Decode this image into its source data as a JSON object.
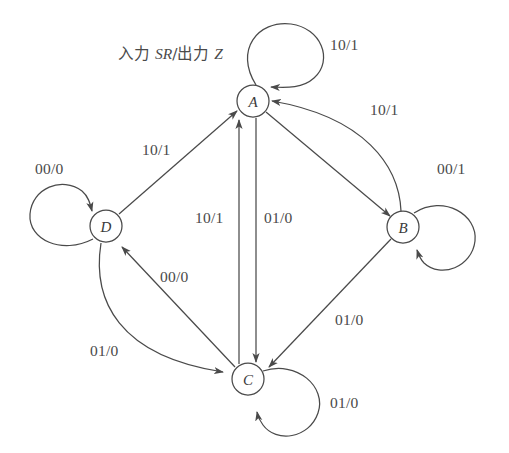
{
  "diagram": {
    "caption_prefix": "入力 ",
    "caption_inputs": "SR",
    "caption_mid": "/出力 ",
    "caption_output": "Z",
    "bottom_caption": "",
    "stroke_color": "#4a4a4a",
    "text_color": "#3a3a3a",
    "background": "#ffffff"
  },
  "states": [
    {
      "id": "A",
      "label": "A",
      "cx": 253,
      "cy": 101,
      "r": 16
    },
    {
      "id": "B",
      "label": "B",
      "cx": 403,
      "cy": 227,
      "r": 16
    },
    {
      "id": "C",
      "label": "C",
      "cx": 248,
      "cy": 379,
      "r": 16
    },
    {
      "id": "D",
      "label": "D",
      "cx": 106,
      "cy": 226,
      "r": 16
    }
  ],
  "transitions": [
    {
      "id": "A-A",
      "from": "A",
      "to": "A",
      "label": "10/1",
      "label_x": 330,
      "label_y": 36,
      "kind": "self-loop-top"
    },
    {
      "id": "B-B",
      "from": "B",
      "to": "B",
      "label": "00/1",
      "label_x": 437,
      "label_y": 160,
      "kind": "self-loop-right"
    },
    {
      "id": "C-C",
      "from": "C",
      "to": "C",
      "label": "01/0",
      "label_x": 330,
      "label_y": 394,
      "kind": "self-loop-bottom-right"
    },
    {
      "id": "D-D",
      "from": "D",
      "to": "D",
      "label": "00/0",
      "label_x": 35,
      "label_y": 160,
      "kind": "self-loop-left"
    },
    {
      "id": "D-A",
      "from": "D",
      "to": "A",
      "label": "10/1",
      "label_x": 142,
      "label_y": 141,
      "kind": "straight"
    },
    {
      "id": "A-B",
      "from": "A",
      "to": "B",
      "label": "",
      "label_x": 0,
      "label_y": 0,
      "kind": "straight"
    },
    {
      "id": "B-A",
      "from": "B",
      "to": "A",
      "label": "10/1",
      "label_x": 370,
      "label_y": 101,
      "kind": "curve"
    },
    {
      "id": "C-A",
      "from": "C",
      "to": "A",
      "label": "10/1",
      "label_x": 195,
      "label_y": 209,
      "kind": "straight-vertical-left"
    },
    {
      "id": "A-C",
      "from": "A",
      "to": "C",
      "label": "01/0",
      "label_x": 264,
      "label_y": 209,
      "kind": "straight-vertical-right"
    },
    {
      "id": "B-C",
      "from": "B",
      "to": "C",
      "label": "01/0",
      "label_x": 335,
      "label_y": 311,
      "kind": "straight"
    },
    {
      "id": "C-D",
      "from": "C",
      "to": "D",
      "label": "00/0",
      "label_x": 160,
      "label_y": 268,
      "kind": "straight"
    },
    {
      "id": "D-C",
      "from": "D",
      "to": "C",
      "label": "01/0",
      "label_x": 90,
      "label_y": 342,
      "kind": "curve"
    }
  ]
}
